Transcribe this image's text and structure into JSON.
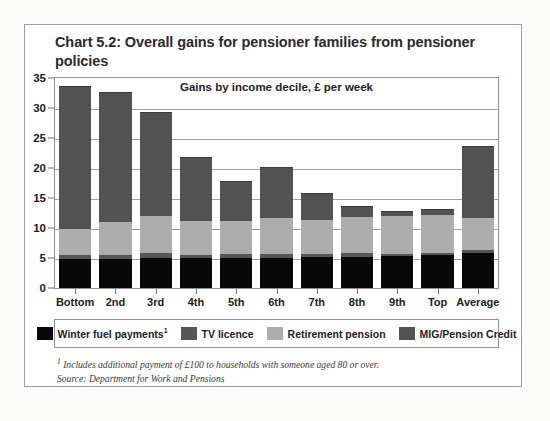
{
  "title": "Chart 5.2: Overall gains for pensioner families from pensioner policies",
  "subtitle": "Gains by income decile, £ per week",
  "footnote_marker": "1",
  "footnote": " Includes additional payment of £100 to households with someone aged 80 or over.",
  "source": "Source: Department for Work and Pensions",
  "legend": {
    "items": [
      {
        "label": "Winter fuel payments",
        "sup": "1",
        "color": "#080808",
        "name": "winter-fuel-payments"
      },
      {
        "label": "TV licence",
        "sup": "",
        "color": "#565656",
        "name": "tv-licence"
      },
      {
        "label": "Retirement pension",
        "sup": "",
        "color": "#adadad",
        "name": "retirement-pension"
      },
      {
        "label": "MIG/Pension Credit",
        "sup": "",
        "color": "#525252",
        "name": "mig-pension-credit"
      }
    ]
  },
  "chart_data": {
    "type": "bar",
    "stacked": true,
    "title": "Chart 5.2: Overall gains for pensioner families from pensioner policies",
    "subtitle": "Gains by income decile, £ per week",
    "xlabel": "",
    "ylabel": "£ per week",
    "ylim": [
      0,
      35
    ],
    "yticks": [
      0,
      5,
      10,
      15,
      20,
      25,
      30,
      35
    ],
    "grid": true,
    "legend_position": "bottom",
    "categories": [
      "Bottom",
      "2nd",
      "3rd",
      "4th",
      "5th",
      "6th",
      "7th",
      "8th",
      "9th",
      "Top",
      "Average"
    ],
    "series": [
      {
        "name": "Winter fuel payments",
        "color": "#080808",
        "values": [
          4.9,
          4.8,
          5.0,
          5.0,
          5.1,
          5.1,
          5.2,
          5.3,
          5.4,
          5.6,
          5.8
        ]
      },
      {
        "name": "TV licence",
        "color": "#565656",
        "values": [
          0.6,
          0.7,
          0.8,
          0.6,
          0.6,
          0.7,
          0.6,
          0.6,
          0.4,
          0.3,
          0.6
        ]
      },
      {
        "name": "Retirement pension",
        "color": "#adadad",
        "values": [
          4.4,
          5.6,
          6.3,
          5.6,
          5.6,
          6.0,
          5.6,
          6.0,
          6.3,
          6.4,
          5.4
        ]
      },
      {
        "name": "MIG/Pension Credit",
        "color": "#525252",
        "values": [
          23.8,
          21.5,
          17.2,
          10.6,
          6.5,
          8.4,
          4.4,
          1.7,
          0.7,
          0.9,
          11.9
        ]
      }
    ],
    "totals": [
      33.7,
      32.6,
      29.3,
      21.8,
      17.8,
      20.2,
      15.8,
      13.6,
      12.8,
      13.2,
      23.7
    ]
  }
}
